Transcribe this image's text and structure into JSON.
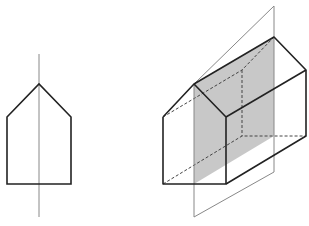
{
  "diagram": {
    "colors": {
      "stroke": "#222222",
      "axis": "#888888",
      "plane_fill": "#c8c8c8",
      "background": "#ffffff"
    },
    "left_figure": {
      "name": "pentagon-with-symmetry-axis",
      "pentagon": "7,117 39,84 71,117 71,184 7,184",
      "axis": {
        "x1": 39,
        "y1": 54,
        "x2": 39,
        "y2": 217
      }
    },
    "right_figure": {
      "name": "prism-with-symmetry-plane",
      "plane_outline": "194,84 274,6 274,172 194,217",
      "plane_fill": "194,84 274,37 274,136 194,184",
      "visible_edges": [
        "163,117 194,84 226,117 226,184 163,184 163,117",
        "194,84 274,37 306,70 306,136 226,184",
        "226,117 306,70"
      ],
      "hidden_edges": [
        "163,117 242,70 274,37",
        "242,70 242,136",
        "163,184 242,136 306,136"
      ]
    }
  }
}
